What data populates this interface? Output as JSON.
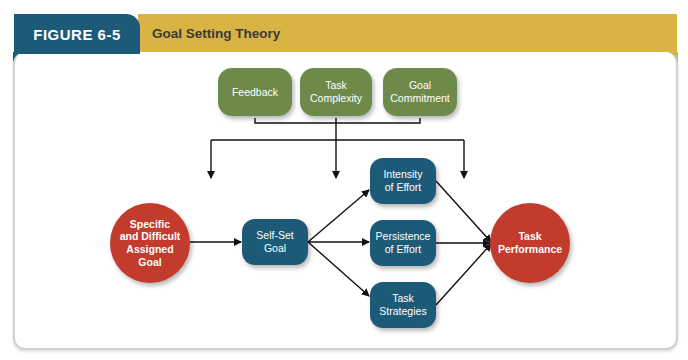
{
  "header": {
    "figure_label": "FIGURE 6-5",
    "title": "Goal Setting Theory"
  },
  "colors": {
    "tab_blue": "#1d5a78",
    "title_gold": "#d9b343",
    "moderator_green": "#6d8a4a",
    "circle_red": "#c23b2d",
    "process_blue": "#1d5a78"
  },
  "diagram": {
    "moderators": [
      {
        "id": "feedback",
        "label": "Feedback"
      },
      {
        "id": "task-complexity",
        "label": "Task\nComplexity"
      },
      {
        "id": "goal-commitment",
        "label": "Goal\nCommitment"
      }
    ],
    "input": {
      "id": "assigned-goal",
      "label": "Specific\nand Difficult\nAssigned\nGoal"
    },
    "mediator": {
      "id": "self-set-goal",
      "label": "Self-Set\nGoal"
    },
    "mechanisms": [
      {
        "id": "intensity",
        "label": "Intensity\nof Effort"
      },
      {
        "id": "persistence",
        "label": "Persistence\nof Effort"
      },
      {
        "id": "strategies",
        "label": "Task\nStrategies"
      }
    ],
    "outcome": {
      "id": "task-performance",
      "label": "Task\nPerformance"
    },
    "edges": [
      {
        "from": "assigned-goal",
        "to": "self-set-goal"
      },
      {
        "from": "self-set-goal",
        "to": "intensity"
      },
      {
        "from": "self-set-goal",
        "to": "persistence"
      },
      {
        "from": "self-set-goal",
        "to": "strategies"
      },
      {
        "from": "intensity",
        "to": "task-performance"
      },
      {
        "from": "persistence",
        "to": "task-performance"
      },
      {
        "from": "strategies",
        "to": "task-performance"
      },
      {
        "from": "moderators",
        "to": "assigned-goal-to-self-set-goal-link"
      },
      {
        "from": "moderators",
        "to": "self-set-goal-to-mechanisms-link"
      },
      {
        "from": "moderators",
        "to": "mechanisms-to-task-performance-link"
      }
    ]
  }
}
